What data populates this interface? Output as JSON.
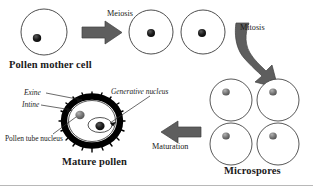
{
  "diagram": {
    "colors": {
      "background": "#ffffff",
      "outline": "#3a3a3a",
      "arrow_fill": "#5e5e5e",
      "arrow_stroke": "#3f3f3f",
      "nucleus_dark": "#141414",
      "nucleus_gray": "#6f6f6f",
      "exine_black": "#000000",
      "text": "#1a1a1a"
    },
    "stages": [
      {
        "id": "pollen-mother-cell",
        "label": "Pollen mother cell",
        "cells": 1
      },
      {
        "id": "dyad-cells",
        "label": "",
        "cells": 2
      },
      {
        "id": "microspores",
        "label": "Microspores",
        "cells": 4
      },
      {
        "id": "mature-pollen",
        "label": "Mature pollen",
        "cells": 1
      }
    ],
    "processes": [
      {
        "id": "meiosis",
        "label": "Meiosis",
        "direction": "right"
      },
      {
        "id": "mitosis",
        "label": "Mitosis",
        "direction": "curved-down"
      },
      {
        "id": "maturation",
        "label": "Maturation",
        "direction": "left"
      }
    ],
    "callouts": [
      {
        "id": "exine",
        "label": "Exine"
      },
      {
        "id": "intine",
        "label": "Intine"
      },
      {
        "id": "pollen-tube-nucleus",
        "label": "Pollen tube nucleus"
      },
      {
        "id": "generative-nucleus",
        "label": "Generative nucleus"
      }
    ]
  }
}
